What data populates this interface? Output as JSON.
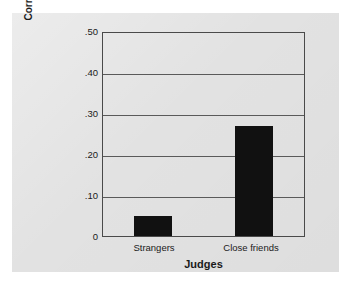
{
  "chart_data": {
    "type": "bar",
    "title": "",
    "subtitle": "",
    "categories": [
      "Strangers",
      "Close friends"
    ],
    "values": [
      0.05,
      0.27
    ],
    "xlabel": "Judges",
    "ylabel": "Correlation with students' own impressions",
    "ylabel_lines": [
      "Correlation with students'",
      "own impressions"
    ],
    "ylim": [
      0,
      0.5
    ],
    "ytick_values": [
      0.5,
      0.4,
      0.3,
      0.2,
      0.1,
      0
    ],
    "ytick_labels": [
      ".50",
      ".40",
      ".30",
      ".20",
      ".10",
      "0"
    ],
    "grid": "horizontal",
    "legend": "none",
    "bar_color": "#111111",
    "panel_color": "#e2e2e2",
    "axis_color": "#4a4a4a",
    "gridline_color": "#5a5a5a"
  }
}
